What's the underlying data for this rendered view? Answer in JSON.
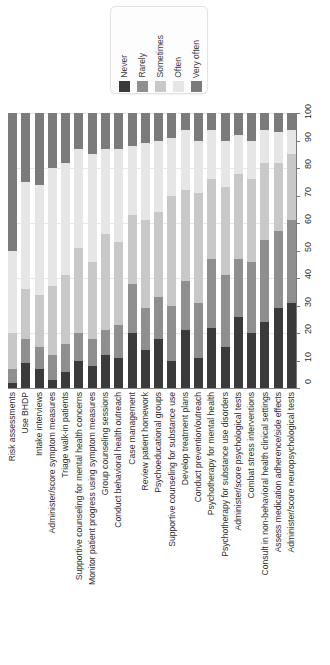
{
  "chart_data": {
    "type": "bar",
    "subtype": "stacked-percentage-bar",
    "title": "",
    "subtitle": "",
    "xlabel": "",
    "ylabel": "",
    "ylim": [
      0,
      100
    ],
    "ytick_labels": [
      "0",
      "10",
      "20",
      "30",
      "40",
      "50",
      "60",
      "70",
      "80",
      "90",
      "100"
    ],
    "ytick_values": [
      0,
      10,
      20,
      30,
      40,
      50,
      60,
      70,
      80,
      90,
      100
    ],
    "grid": true,
    "gridlines_at": [
      20,
      40,
      60,
      80,
      100
    ],
    "legend_position": "top-center",
    "orientation": "vertical",
    "categories": [
      "Risk assessments",
      "Use BHDP",
      "Intake interviews",
      "Administer/score symptom measures",
      "Triage walk-in patients",
      "Supportive counseling for mental health concerns",
      "Monitor patient progress using symptom measures",
      "Group counseling sessions",
      "Conduct behavioral health outreach",
      "Case management",
      "Review patient homework",
      "Psychoeducational groups",
      "Supportive counseling for substance use",
      "Develop treatment plans",
      "Conduct prevention/outreach",
      "Psychotherapy for mental health",
      "Psychotherapy for substance use disorders",
      "Administer/score psychological tests",
      "Combat stress interventions",
      "Consult in non-behavioral health clinical settings",
      "Assess medication adherence/side effects",
      "Administer/score neuropsychological tests"
    ],
    "series": [
      {
        "name": "Never",
        "color": "#3a3a3a",
        "values": [
          2,
          9,
          7,
          3,
          6,
          10,
          8,
          12,
          11,
          20,
          14,
          18,
          10,
          21,
          11,
          22,
          15,
          26,
          20,
          24,
          29,
          31
        ]
      },
      {
        "name": "Rarely",
        "color": "#8f8f8f",
        "values": [
          5,
          9,
          8,
          9,
          10,
          10,
          10,
          9,
          12,
          18,
          15,
          15,
          20,
          18,
          20,
          25,
          26,
          21,
          26,
          30,
          28,
          30
        ]
      },
      {
        "name": "Sometimes",
        "color": "#c8c8c8",
        "values": [
          13,
          18,
          19,
          25,
          25,
          31,
          28,
          35,
          30,
          25,
          32,
          31,
          40,
          33,
          40,
          29,
          32,
          31,
          30,
          28,
          25,
          24
        ]
      },
      {
        "name": "Often",
        "color": "#e6e6e6",
        "values": [
          30,
          39,
          40,
          43,
          41,
          36,
          39,
          31,
          34,
          25,
          28,
          26,
          21,
          22,
          19,
          18,
          17,
          14,
          14,
          12,
          11,
          9
        ]
      },
      {
        "name": "Very often",
        "color": "#7b7b7b",
        "values": [
          50,
          25,
          26,
          20,
          18,
          13,
          15,
          13,
          13,
          12,
          11,
          10,
          9,
          6,
          10,
          6,
          10,
          8,
          10,
          6,
          7,
          6
        ]
      }
    ]
  },
  "legend": {
    "entries": [
      {
        "label": "Never",
        "swatch_color": "#3a3a3a"
      },
      {
        "label": "Rarely",
        "swatch_color": "#8f8f8f"
      },
      {
        "label": "Sometimes",
        "swatch_color": "#c8c8c8"
      },
      {
        "label": "Often",
        "swatch_color": "#e6e6e6"
      },
      {
        "label": "Very often",
        "swatch_color": "#7b7b7b"
      }
    ]
  }
}
